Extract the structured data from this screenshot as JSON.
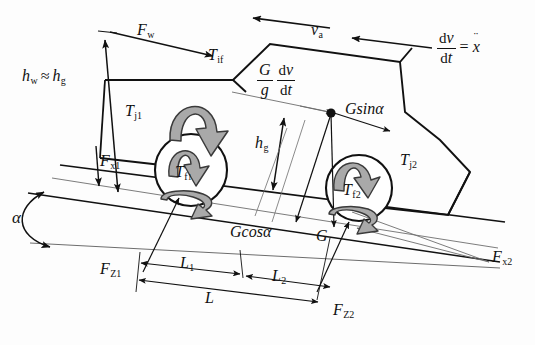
{
  "figure": {
    "type": "free-body-diagram",
    "stroke_color": "#111111",
    "thin_line_color": "#5a5a5a",
    "torque_arrow_fill": "#a9a9a9",
    "torque_arrow_stroke": "#3a3a3a",
    "background": "#fdfdfd"
  },
  "labels": {
    "height_relation_lhs": "h",
    "height_relation_lhs_sub": "w",
    "height_relation_op": "≈",
    "height_relation_rhs": "h",
    "height_relation_rhs_sub": "g",
    "wind_force": "F",
    "wind_force_sub": "w",
    "front_traction": "F",
    "front_traction_sub": "x1",
    "rear_traction": "F",
    "rear_traction_sub": "x2",
    "front_normal": "F",
    "front_normal_sub": "Z1",
    "rear_normal": "F",
    "rear_normal_sub": "Z2",
    "inertia_torque": "T",
    "inertia_torque_sub": "if",
    "front_wheel_inertia_torque": "T",
    "front_wheel_inertia_torque_sub": "j1",
    "rear_wheel_inertia_torque": "T",
    "rear_wheel_inertia_torque_sub": "j2",
    "front_rolling_torque": "T",
    "front_rolling_torque_sub": "f",
    "front_rolling_torque_subsub": "1",
    "rear_rolling_torque": "T",
    "rear_rolling_torque_sub": "f2",
    "velocity": "v",
    "velocity_sub": "a",
    "cg_height": "h",
    "cg_height_sub": "g",
    "weight": "G",
    "weight_normal_component": "Gcos",
    "weight_normal_component_angle": "α",
    "weight_parallel_component": "Gsin",
    "weight_parallel_component_angle": "α",
    "slope_angle": "α",
    "wheelbase_front": "L",
    "wheelbase_front_sub": "1",
    "wheelbase_rear": "L",
    "wheelbase_rear_sub": "2",
    "wheelbase_total": "L",
    "inertia_force_num": "G",
    "inertia_force_den": "g",
    "accel_num_d": "d",
    "accel_num_v": "v",
    "accel_den_d": "d",
    "accel_den_t": "t",
    "accel_equals": "=",
    "accel_xddot": "x",
    "accel_xddot_dots": "¨"
  }
}
